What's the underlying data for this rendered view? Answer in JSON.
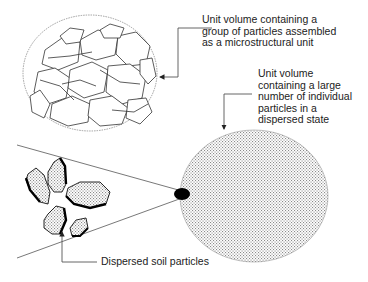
{
  "labels": {
    "aggregate": "Unit volume containing a\ngroup of particles assembled\nas a microstructural unit",
    "dispersed_volume": "Unit volume\ncontaining a large\nnumber of individual\nparticles in a\ndispersed state",
    "dispersed_particles": "Dispersed soil particles"
  },
  "colors": {
    "line": "#555555",
    "particle_edge": "#111111",
    "dot": "#000000",
    "stipple": "#9a9a9a"
  }
}
